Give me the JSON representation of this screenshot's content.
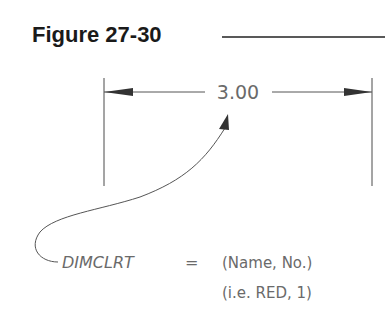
{
  "figure": {
    "title": "Figure 27-30"
  },
  "dimension": {
    "value_text": "3.00"
  },
  "annotation": {
    "variable": "DIMCLRT",
    "equals": "=",
    "line1": "(Name, No.)",
    "line2": "(i.e. RED, 1)"
  },
  "colors": {
    "title": "#1a1a1a",
    "linework": "#4a4a4a",
    "text": "#6a6a6a"
  }
}
